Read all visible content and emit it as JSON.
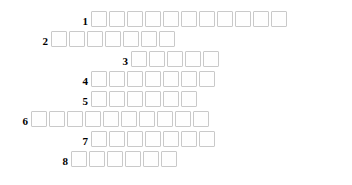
{
  "puzzle": {
    "type": "crossword-word-grid",
    "title": "",
    "cell_size_px": 18,
    "cell_pitch_px": 20,
    "row_pitch_px": 20,
    "grid_origin_x_px": 11,
    "grid_origin_y_px": 11,
    "colors": {
      "cell_border": "#c9c9c9",
      "cell_fill": "#fefefe",
      "page_background": "#ffffff",
      "number_text": "#000000"
    },
    "rows": [
      {
        "number": "1",
        "start_column": 4,
        "cell_count": 11,
        "left_px": 91,
        "top_px": 11,
        "label_left_px": 72,
        "letters": [
          "",
          "",
          "",
          "",
          "",
          "",
          "",
          "",
          "",
          "",
          ""
        ]
      },
      {
        "number": "2",
        "start_column": 2,
        "cell_count": 7,
        "left_px": 51,
        "top_px": 31,
        "label_left_px": 32,
        "letters": [
          "",
          "",
          "",
          "",
          "",
          "",
          ""
        ]
      },
      {
        "number": "3",
        "start_column": 6,
        "cell_count": 5,
        "left_px": 131,
        "top_px": 51,
        "label_left_px": 112,
        "letters": [
          "",
          "",
          "",
          "",
          ""
        ]
      },
      {
        "number": "4",
        "start_column": 4,
        "cell_count": 7,
        "left_px": 91,
        "top_px": 71,
        "label_left_px": 72,
        "letters": [
          "",
          "",
          "",
          "",
          "",
          "",
          ""
        ]
      },
      {
        "number": "5",
        "start_column": 4,
        "cell_count": 6,
        "left_px": 91,
        "top_px": 91,
        "label_left_px": 72,
        "letters": [
          "",
          "",
          "",
          "",
          "",
          ""
        ]
      },
      {
        "number": "6",
        "start_column": 1,
        "cell_count": 10,
        "left_px": 31,
        "top_px": 111,
        "label_left_px": 12,
        "letters": [
          "",
          "",
          "",
          "",
          "",
          "",
          "",
          "",
          "",
          ""
        ]
      },
      {
        "number": "7",
        "start_column": 4,
        "cell_count": 7,
        "left_px": 91,
        "top_px": 131,
        "label_left_px": 72,
        "letters": [
          "",
          "",
          "",
          "",
          "",
          "",
          ""
        ]
      },
      {
        "number": "8",
        "start_column": 3,
        "cell_count": 6,
        "left_px": 71,
        "top_px": 151,
        "label_left_px": 52,
        "letters": [
          "",
          "",
          "",
          "",
          "",
          ""
        ]
      }
    ]
  }
}
